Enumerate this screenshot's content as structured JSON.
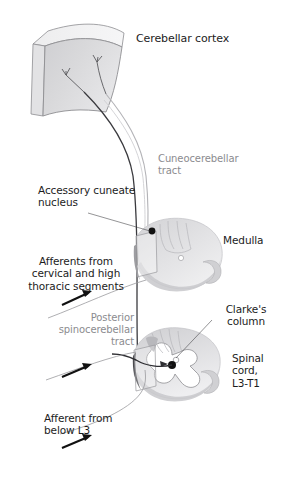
{
  "figure": {
    "background_color": "#ffffff",
    "label_color_dark": "#1c1c1c",
    "label_color_gray": "#8b8b8f",
    "structure_fill": "#d8d8da",
    "structure_stroke": "#6e6e72"
  },
  "labels": {
    "cerebellar_cortex": "Cerebellar cortex",
    "cuneocerebellar_tract": "Cuneocerebellar\ntract",
    "accessory_cuneate_nucleus": "Accessory cuneate\nnucleus",
    "medulla": "Medulla",
    "afferents_cervical": "Afferents from\ncervical and high\nthoracic segments",
    "posterior_spinocerebellar_tract": "Posterior\nspinocerebellar\ntract",
    "clarkes_column": "Clarke's\ncolumn",
    "spinal_cord": "Spinal\ncord,\nL3-T1",
    "afferent_below_l3": "Afferent from\nbelow L3"
  },
  "structures": [
    {
      "name": "cerebellar-cortex",
      "kind": "slab"
    },
    {
      "name": "medulla-cross-section",
      "kind": "cross-section"
    },
    {
      "name": "spinal-cord-cross-section",
      "kind": "cross-section"
    }
  ],
  "markers": [
    {
      "name": "accessory-cuneate-nucleus-dot",
      "color": "#111111"
    },
    {
      "name": "clarkes-column-dot",
      "color": "#111111"
    }
  ],
  "arrows": [
    {
      "name": "afferent-arrow-cervical"
    },
    {
      "name": "afferent-arrow-lumbar"
    },
    {
      "name": "afferent-arrow-below-l3"
    }
  ]
}
